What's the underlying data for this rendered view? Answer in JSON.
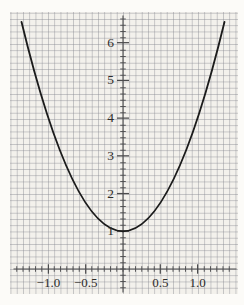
{
  "figure": {
    "colors": {
      "margin": "#fcfbf8",
      "paper": "#f3f1ec",
      "grid": "#8a8c94",
      "axis": "#4b4b4d",
      "curve": "#1b1b1b",
      "label": "#2e2c2a"
    }
  },
  "chart_data": {
    "type": "line",
    "title": "",
    "xlabel": "",
    "ylabel": "",
    "function": "y = 3x^2 + 1",
    "x_range_drawn": [
      -1.36,
      1.36
    ],
    "xlim": [
      -1.51,
      1.54
    ],
    "ylim": [
      -0.72,
      6.81
    ],
    "grid": {
      "style": "fine graph paper",
      "minor_cells_per_half_x_unit": 6,
      "minor_cells_per_y_unit": 6
    },
    "x_ticks": {
      "values": [
        -1.0,
        -0.5,
        0.5,
        1.0
      ],
      "labels": [
        "−1.0",
        "−0.5",
        "0.5",
        "1.0"
      ]
    },
    "y_ticks": {
      "values": [
        1,
        2,
        3,
        4,
        5,
        6
      ],
      "labels": [
        "1",
        "2",
        "3",
        "4",
        "5",
        "6"
      ]
    },
    "series": [
      {
        "name": "y = 3x^2 + 1",
        "x": [
          -1.36,
          -1.25,
          -1.0,
          -0.75,
          -0.5,
          -0.25,
          0,
          0.25,
          0.5,
          0.75,
          1.0,
          1.25,
          1.36
        ],
        "y": [
          6.55,
          5.69,
          4.0,
          2.69,
          1.75,
          1.19,
          1.0,
          1.19,
          1.75,
          2.69,
          4.0,
          5.69,
          6.55
        ]
      }
    ],
    "legend": {
      "visible": false
    }
  }
}
